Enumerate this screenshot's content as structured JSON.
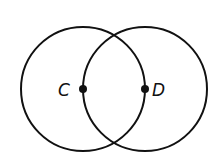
{
  "diagram": {
    "type": "two intersecting circles",
    "circles": [
      {
        "name": "circle-C",
        "cx": 83,
        "cy": 89,
        "r": 62
      },
      {
        "name": "circle-D",
        "cx": 145,
        "cy": 89,
        "r": 62
      }
    ],
    "points": [
      {
        "label": "C",
        "x": 83,
        "y": 89
      },
      {
        "label": "D",
        "x": 145,
        "y": 89
      }
    ],
    "stroke_color": "#111111",
    "background": "#ffffff"
  }
}
